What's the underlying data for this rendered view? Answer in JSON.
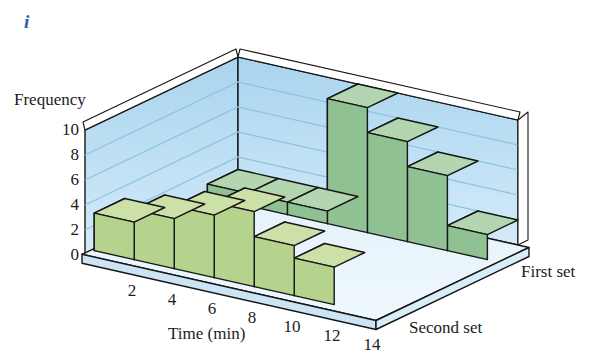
{
  "figure_label": "i",
  "labels": {
    "y_axis": "Frequency",
    "x_axis": "Time (min)",
    "series_back": "First set",
    "series_front": "Second set"
  },
  "chart_data": {
    "type": "bar",
    "subtype": "3d-double-row-histogram",
    "x_label": "Time (min)",
    "y_label": "Frequency",
    "x_ticks": [
      2,
      4,
      6,
      8,
      10,
      12,
      14
    ],
    "y_ticks": [
      0,
      2,
      4,
      6,
      8,
      10
    ],
    "ylim": [
      0,
      10
    ],
    "bin_width": 2,
    "categories": [
      "0-2",
      "2-4",
      "4-6",
      "6-8",
      "8-10",
      "10-12",
      "12-14"
    ],
    "series": [
      {
        "name": "First set",
        "row": "back",
        "values": [
          1,
          1,
          1,
          10,
          8,
          6,
          2
        ]
      },
      {
        "name": "Second set",
        "row": "front",
        "values": [
          3,
          4,
          5,
          6,
          4,
          3,
          0
        ]
      }
    ],
    "grid": "horizontal lines every 2 units on walls",
    "legend_position": "axis labels beside rows (right side)"
  },
  "colors": {
    "figure_label": "#2b5cab",
    "text": "#1c1c1c",
    "outline": "#161616",
    "wall_top": "#a9d4ee",
    "wall_bottom": "#d4ebf9",
    "floor_top": "#e3f1fa",
    "floor_bottom": "#eff8fd",
    "slab_front": "#cbe5f5",
    "slab_side": "#d8edf8",
    "gridline": "#8cc2e2",
    "rim": "#ffffff",
    "front_bar_face": "#b6d38d",
    "front_bar_top": "#cde0a7",
    "front_bar_side": "#9abe71",
    "back_bar_face": "#8fc192",
    "back_bar_top": "#b3d6b1",
    "back_bar_side": "#7bb07f"
  }
}
